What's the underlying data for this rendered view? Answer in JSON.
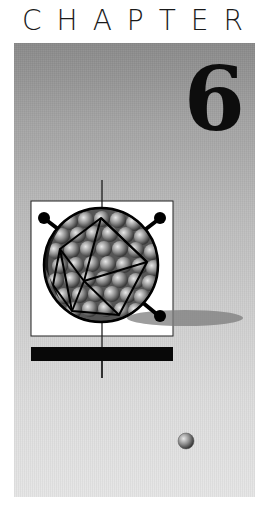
{
  "page": {
    "heading_word": "CHAPTER",
    "chapter_number": "6"
  },
  "illustration": {
    "subject": "icosahedral-virus-particle-icon",
    "colors": {
      "panel_top": "#8a8a8a",
      "panel_bottom": "#e6e6e6",
      "box_fill": "#ffffff",
      "ink": "#0d0d0d"
    }
  }
}
